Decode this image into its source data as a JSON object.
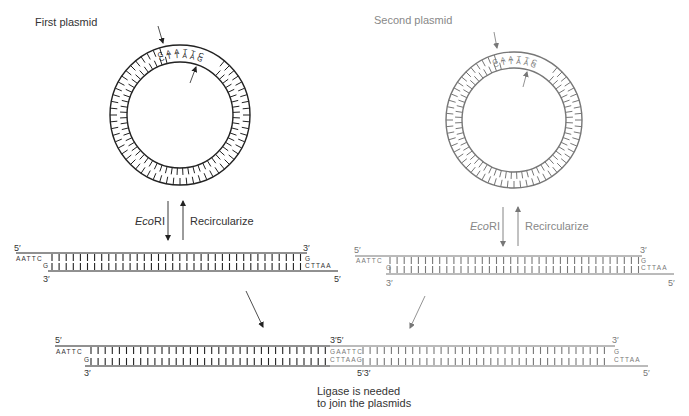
{
  "title_left": "First plasmid",
  "title_right": "Second plasmid",
  "plasmids": [
    {
      "id": "first",
      "label": "First plasmid",
      "center": [
        180,
        115
      ],
      "outer_radius": 70,
      "inner_radius": 53,
      "color": "#222222",
      "site_top": "GAATTC",
      "site_bottom": "CTTAAG"
    },
    {
      "id": "second",
      "label": "Second plasmid",
      "center": [
        514,
        120
      ],
      "outer_radius": 68,
      "inner_radius": 52,
      "color": "#777777",
      "site_top": "GAATTC",
      "site_bottom": "CTTAAG"
    }
  ],
  "steps": {
    "cut_enzyme_prefix": "Eco",
    "cut_enzyme_suffix": "RI",
    "recircularize": "Recircularize"
  },
  "fragments": {
    "left": {
      "top_5_label": "5′",
      "top_3_label": "3′",
      "bottom_3_label": "3′",
      "bottom_5_label": "5′",
      "left_overhang": "AATTC",
      "left_g": "G",
      "right_g": "G",
      "right_overhang": "CTTAA"
    },
    "right": {
      "top_5_label": "5′",
      "top_3_label": "3′",
      "bottom_3_label": "3′",
      "bottom_5_label": "5′",
      "left_overhang": "AATTC",
      "left_g": "G",
      "right_g": "G",
      "right_overhang": "CTTAA"
    }
  },
  "joined": {
    "top_5_label": "5′",
    "junction_top_label": "3′5′",
    "top_3_label": "3′",
    "bottom_3_label": "3′",
    "junction_bottom_label": "5′3′",
    "bottom_5_label": "5′",
    "left_overhang": "AATTC",
    "left_g": "G",
    "junction_top_seq": "GAATTC",
    "junction_bottom_seq": "CTTAAG",
    "right_g": "G",
    "right_overhang": "CTTAA"
  },
  "caption_line1": "Ligase is needed",
  "caption_line2": "to join the plasmids"
}
